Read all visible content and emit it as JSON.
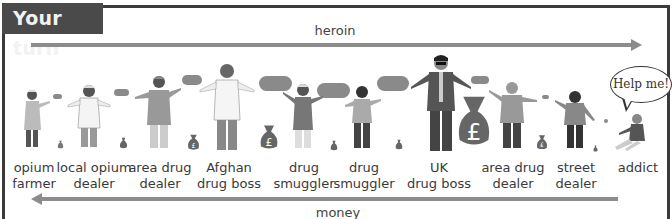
{
  "header": {
    "title": "Your turn"
  },
  "flows": {
    "forward_label": "heroin",
    "backward_label": "money"
  },
  "speech": {
    "text": "Help me!"
  },
  "roles": [
    {
      "line1": "opium",
      "line2": "farmer"
    },
    {
      "line1": "local opium",
      "line2": "dealer"
    },
    {
      "line1": "area drug",
      "line2": "dealer"
    },
    {
      "line1": "Afghan",
      "line2": "drug boss"
    },
    {
      "line1": "drug",
      "line2": "smuggler"
    },
    {
      "line1": "drug",
      "line2": "smuggler"
    },
    {
      "line1": "UK",
      "line2": "drug boss"
    },
    {
      "line1": "area drug",
      "line2": "dealer"
    },
    {
      "line1": "street",
      "line2": "dealer"
    },
    {
      "line1": "addict",
      "line2": ""
    }
  ],
  "icons": {
    "money_bag": "pound-money-bag-icon",
    "drug_package": "heroin-package-icon"
  },
  "colors": {
    "header_bg": "#4a4a4a",
    "arrow": "#8c8c8c",
    "border": "#3b3b3b"
  }
}
